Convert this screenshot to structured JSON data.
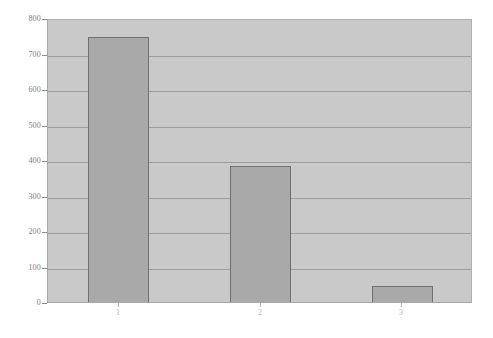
{
  "chart_data": {
    "type": "bar",
    "title": "",
    "subtitle": "",
    "xlabel": "",
    "ylabel": "",
    "categories": [
      "1",
      "2",
      "3"
    ],
    "values": [
      752,
      390,
      52
    ],
    "series": [
      {
        "name": "series-1",
        "values": [
          752,
          390,
          52
        ]
      }
    ],
    "ylim": [
      0,
      800
    ],
    "ytick_labels": [
      "0",
      "100",
      "200",
      "300",
      "400",
      "500",
      "600",
      "700",
      "800"
    ],
    "ytick_values": [
      0,
      100,
      200,
      300,
      400,
      500,
      600,
      700,
      800
    ],
    "xtick_labels": [
      "1",
      "2",
      "3"
    ],
    "grid": "horizontal",
    "legend": "none",
    "annotations": [],
    "colors": {
      "bar_fill": "#a9a9a9",
      "bar_edge": "#6f6f6f",
      "plot_background": "#c9c9c9",
      "gridline": "#9d9d9d",
      "axis_line": "#a8a8a8",
      "ytick_text": "#7c7c7c",
      "xtick_text": "#b2b2b2",
      "figure_background": "#ffffff"
    }
  }
}
